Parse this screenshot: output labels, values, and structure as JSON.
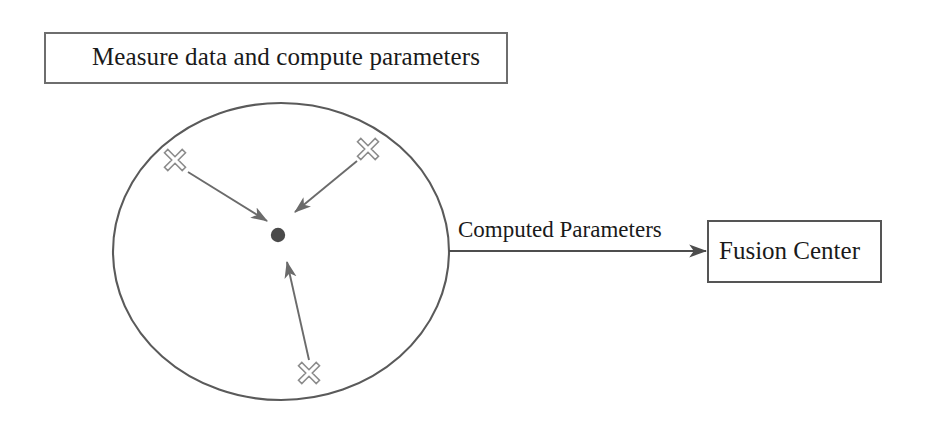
{
  "figure": {
    "type": "system-diagram",
    "background_color": "#ffffff"
  },
  "legend": {
    "marker_icon": "x-marker-icon",
    "label": "Measure data and compute parameters",
    "border_color": "#6e6e6e",
    "text_color": "#1a1a1a"
  },
  "sensor_field": {
    "shape": "ellipse",
    "stroke_color": "#5a5a5a",
    "center_node": {
      "icon": "filled-dot-icon",
      "color": "#4a4a4a",
      "label": ""
    },
    "sensors": [
      {
        "id": "sensor-top-left",
        "icon": "x-marker-icon",
        "position": "top-left"
      },
      {
        "id": "sensor-top-right",
        "icon": "x-marker-icon",
        "position": "top-right"
      },
      {
        "id": "sensor-bottom",
        "icon": "x-marker-icon",
        "position": "bottom-center"
      }
    ],
    "arrows": [
      {
        "id": "arrow-top-left-to-center",
        "from": "sensor-top-left",
        "to": "center-node"
      },
      {
        "id": "arrow-top-right-to-center",
        "from": "sensor-top-right",
        "to": "center-node"
      },
      {
        "id": "arrow-bottom-to-center",
        "from": "sensor-bottom",
        "to": "center-node"
      }
    ]
  },
  "output_edge": {
    "label": "Computed Parameters",
    "arrow_color": "#4d4d4d",
    "from": "sensor-field",
    "to": "fusion-center"
  },
  "fusion_center": {
    "label": "Fusion Center",
    "border_color": "#555555",
    "text_color": "#1a1a1a"
  },
  "colors": {
    "marker_stroke": "#8c8c8c",
    "arrow": "#6b6b6b",
    "circle_stroke": "#5a5a5a",
    "text": "#1a1a1a"
  }
}
